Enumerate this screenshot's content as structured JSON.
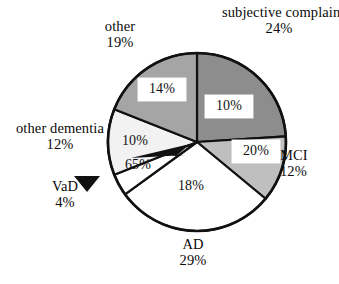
{
  "chart_data": {
    "type": "pie",
    "title": "",
    "subtitle": "",
    "xlabel": "",
    "ylabel": "",
    "legend_position": "none",
    "grid": false,
    "labels_unit": "%",
    "center": {
      "cx": 197,
      "cy": 142,
      "r": 89
    },
    "start_angle_deg": 0,
    "direction": "clockwise",
    "categories": [
      "subjective complaints",
      "MCI",
      "AD",
      "VaD",
      "other dementia",
      "other"
    ],
    "values": [
      24,
      12,
      29,
      4,
      12,
      19
    ],
    "series": [
      {
        "name": "share of total",
        "values": [
          24,
          12,
          29,
          4,
          12,
          19
        ]
      },
      {
        "name": "inner annotation",
        "values": [
          10,
          20,
          18,
          65,
          10,
          14
        ]
      }
    ],
    "slices": [
      {
        "name": "subjective complaints",
        "outer_label": "subjective complaints",
        "outer_pct": "24%",
        "value": 24,
        "inner_pct": "10%",
        "inner_value": 10,
        "inner_boxed": true,
        "fill": "#8d8d8d",
        "stroke": "#111111"
      },
      {
        "name": "MCI",
        "outer_label": "MCI",
        "outer_pct": "12%",
        "value": 12,
        "inner_pct": "20%",
        "inner_value": 20,
        "inner_boxed": true,
        "fill": "#bfbfbf",
        "stroke": "#111111"
      },
      {
        "name": "AD",
        "outer_label": "AD",
        "outer_pct": "29%",
        "value": 29,
        "inner_pct": "18%",
        "inner_value": 18,
        "inner_boxed": false,
        "fill": "#ffffff",
        "stroke": "#111111"
      },
      {
        "name": "VaD",
        "outer_label": "VaD",
        "outer_pct": "4%",
        "value": 4,
        "inner_pct": "65%",
        "inner_value": 65,
        "inner_boxed": false,
        "fill": "#ffffff",
        "stroke": "#111111"
      },
      {
        "name": "other dementia",
        "outer_label": "other dementia",
        "outer_pct": "12%",
        "value": 12,
        "inner_pct": "10%",
        "inner_value": 10,
        "inner_boxed": false,
        "fill": "#f2f2f2",
        "stroke": "#111111"
      },
      {
        "name": "other",
        "outer_label": "other",
        "outer_pct": "19%",
        "value": 19,
        "inner_pct": "14%",
        "inner_value": 14,
        "inner_boxed": true,
        "fill": "#a5a5a5",
        "stroke": "#111111"
      }
    ],
    "colors": {
      "subjective_complaints": "#8d8d8d",
      "mci": "#bfbfbf",
      "ad": "#ffffff",
      "vad": "#ffffff",
      "other_dementia": "#f2f2f2",
      "other": "#a5a5a5",
      "outline": "#111111",
      "background": "#ffffff",
      "text": "#0d0d0d"
    },
    "annotations": [
      {
        "name": "vad-pointer-arrow",
        "kind": "arrow",
        "points_to": "VaD slice"
      },
      {
        "name": "sixtyfive-pointer-arrow",
        "kind": "arrow",
        "points_to": "pie center / VaD wedge"
      }
    ]
  }
}
